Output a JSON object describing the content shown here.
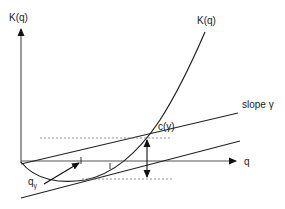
{
  "diagram": {
    "type": "economic cost-function diagram",
    "labels": {
      "y_axis": "K(q)",
      "x_axis": "q",
      "curve": "K(q)",
      "slope_line": "slope γ",
      "gap": "c(γ)",
      "point": "q",
      "point_subscript": "γ"
    },
    "colors": {
      "stroke": "#222222",
      "axis": "#555555",
      "dotted": "#777777",
      "background": "#ffffff"
    }
  }
}
